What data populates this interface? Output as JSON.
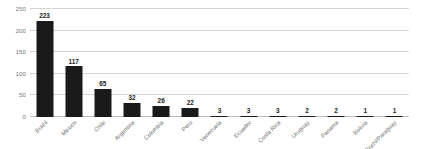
{
  "chart_data": {
    "type": "bar",
    "title": "",
    "subtitle": "",
    "xlabel": "",
    "ylabel": "",
    "ylim": [
      0,
      250
    ],
    "yticks": [
      0,
      50,
      100,
      150,
      200,
      250
    ],
    "grid": true,
    "legend": false,
    "legend_position": "none",
    "orientation": "vertical",
    "bar_color": "#1a1a1a",
    "gridline_color": "#d4d4d4",
    "axis_color": "#bdbdbd",
    "label_color": "#6e6e6e",
    "value_label_color": "#1a1a1a",
    "background_color": "#ffffff",
    "xtick_rotation": -45,
    "categories": [
      "Brazil",
      "Mexico",
      "Chile",
      "Argentina",
      "Colombia",
      "Peru",
      "Venezuela",
      "Ecuador",
      "Costa Rica",
      "Uruguay",
      "Panama",
      "Bolivia",
      "Brazil/Paraguay"
    ],
    "values": [
      223,
      117,
      65,
      32,
      26,
      22,
      3,
      3,
      3,
      2,
      2,
      1,
      1
    ],
    "data_labels": [
      "223",
      "117",
      "65",
      "32",
      "26",
      "22",
      "3",
      "3",
      "3",
      "2",
      "2",
      "1",
      "1"
    ],
    "ytick_labels": [
      "0",
      "50",
      "100",
      "150",
      "200",
      "250"
    ]
  }
}
